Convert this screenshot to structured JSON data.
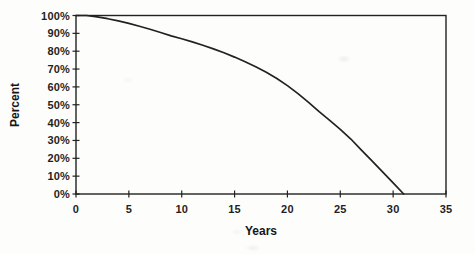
{
  "page": {
    "background": "#fdfdfc",
    "ink": "#222222"
  },
  "chart_data": {
    "type": "line",
    "title": "",
    "xlabel": "Years",
    "ylabel": "Percent",
    "xlim": [
      0,
      35
    ],
    "ylim": [
      0,
      100
    ],
    "grid": false,
    "legend": null,
    "frame": true,
    "tick_style": "cross",
    "x_ticks": [
      0,
      5,
      10,
      15,
      20,
      25,
      30,
      35
    ],
    "x_tick_labels": [
      "0",
      "5",
      "10",
      "15",
      "20",
      "25",
      "30",
      "35"
    ],
    "y_ticks": [
      0,
      10,
      20,
      30,
      40,
      50,
      60,
      70,
      80,
      90,
      100
    ],
    "y_tick_labels": [
      "0%",
      "10%",
      "20%",
      "30%",
      "40%",
      "50%",
      "60%",
      "70%",
      "80%",
      "90%",
      "100%"
    ],
    "series": [
      {
        "name": "percent-remaining",
        "color": "#222222",
        "x": [
          0,
          1,
          2,
          3,
          4,
          5,
          6,
          7,
          8,
          9,
          10,
          11,
          12,
          13,
          14,
          15,
          16,
          17,
          18,
          19,
          20,
          21,
          22,
          23,
          24,
          25,
          26,
          27,
          28,
          29,
          30,
          31
        ],
        "y": [
          100,
          100,
          99.2,
          98.2,
          97.0,
          95.6,
          94.0,
          92.3,
          90.5,
          88.6,
          87.0,
          85.2,
          83.3,
          81.3,
          79.1,
          76.7,
          74.1,
          71.3,
          68.2,
          64.7,
          60.7,
          56.2,
          51.3,
          46.1,
          41.2,
          36.2,
          30.8,
          24.6,
          18.6,
          12.4,
          6.2,
          0
        ]
      }
    ]
  }
}
